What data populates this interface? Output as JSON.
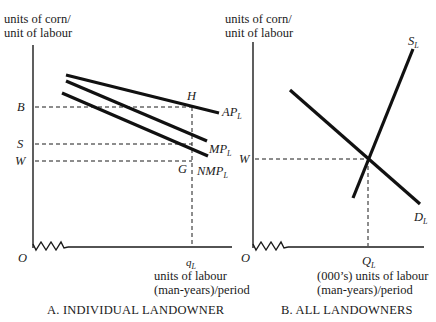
{
  "panel_a": {
    "y_axis_label_line1": "units of corn/",
    "y_axis_label_line2": "unit of labour",
    "x_axis_label_line1": "units of labour",
    "x_axis_label_line2": "(man-years)/period",
    "origin": "O",
    "y_ticks": {
      "b": "B",
      "s": "S",
      "w": "W"
    },
    "x_tick": {
      "main": "q",
      "sub": "L"
    },
    "points": {
      "h": "H",
      "g": "G"
    },
    "curves": {
      "ap": {
        "main": "AP",
        "sub": "L"
      },
      "mp": {
        "main": "MP",
        "sub": "L"
      },
      "nmp": {
        "main": "NMP",
        "sub": "L"
      }
    },
    "caption": "A. INDIVIDUAL LANDOWNER"
  },
  "panel_b": {
    "y_axis_label_line1": "units of corn/",
    "y_axis_label_line2": "unit of labour",
    "x_axis_label_line1": "(000’s) units of labour",
    "x_axis_label_line2": "(man-years)/period",
    "origin": "O",
    "y_tick": "W",
    "x_tick": {
      "main": "Q",
      "sub": "L"
    },
    "curves": {
      "supply": {
        "main": "S",
        "sub": "L"
      },
      "demand": {
        "main": "D",
        "sub": "L"
      }
    },
    "caption": "B. ALL LANDOWNERS"
  },
  "colors": {
    "ink": "#1a1a1a",
    "background": "#ffffff"
  }
}
